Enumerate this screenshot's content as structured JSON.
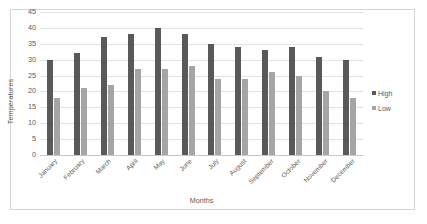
{
  "chart_data": {
    "type": "bar",
    "title": "",
    "xlabel": "Months",
    "ylabel": "Temperatures",
    "categories": [
      "January",
      "February",
      "March",
      "April",
      "May",
      "June",
      "July",
      "August",
      "September",
      "October",
      "November",
      "December"
    ],
    "series": [
      {
        "name": "High",
        "color": "#595959",
        "values": [
          30,
          32,
          37,
          38,
          40,
          38,
          35,
          34,
          33,
          34,
          31,
          30
        ]
      },
      {
        "name": "Low",
        "color": "#a5a5a5",
        "values": [
          18,
          21,
          22,
          27,
          27,
          28,
          24,
          24,
          26,
          25,
          20,
          18
        ]
      }
    ],
    "ylim": [
      0,
      45
    ],
    "ytick_step": 5,
    "yticks": [
      0,
      5,
      10,
      15,
      20,
      25,
      30,
      35,
      40,
      45
    ],
    "grid": "horizontal",
    "legend_position": "right",
    "plot_border_color": "#d4d4d4",
    "gridline_color": "#e3e3e3"
  },
  "legend": {
    "entries": [
      {
        "label": "High",
        "marker": "square-swatch-dark"
      },
      {
        "label": "Low",
        "marker": "square-swatch-light"
      }
    ]
  }
}
